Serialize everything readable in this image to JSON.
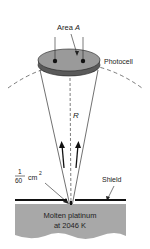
{
  "diagram": {
    "labels": {
      "area": "Area",
      "area_var": "A",
      "photocell": "Photocell",
      "radius": "R",
      "fraction_num": "1",
      "fraction_den": "60",
      "aperture_unit": "cm",
      "aperture_exp": "2",
      "shield": "Shield",
      "source_line1": "Molten platinum",
      "source_line2": "at 2046 K"
    },
    "colors": {
      "photocell_top": "#9a9a9a",
      "photocell_edge": "#5a5a5a",
      "molten_platinum": "#a8a8a8",
      "line": "#222222"
    }
  }
}
